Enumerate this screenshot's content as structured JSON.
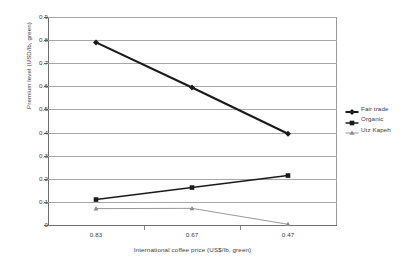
{
  "chart_data": {
    "type": "line",
    "title": "",
    "xlabel": "International coffee price (US$/lb, green)",
    "ylabel": "Premium level (USD/lb, green)",
    "categories": [
      "0.83",
      "0.67",
      "0.47"
    ],
    "x_tick_labels": [
      "0.83",
      "0.67",
      "0.47"
    ],
    "y_tick_labels": [
      "0.9",
      "0.8",
      "0.7",
      "0.6",
      "0.5",
      "0.4",
      "0.3",
      "0.2",
      "0.1",
      "0"
    ],
    "y_tick_values": [
      0.9,
      0.8,
      0.7,
      0.6,
      0.5,
      0.4,
      0.3,
      0.2,
      0.1,
      0
    ],
    "ylim": [
      0,
      0.9
    ],
    "grid": "horizontal",
    "legend_position": "right",
    "series": [
      {
        "name": "Fair trade",
        "marker": "diamond",
        "color": "#1a1a1a",
        "line_width": 2.1,
        "values": [
          0.79,
          0.595,
          0.395
        ]
      },
      {
        "name": "Organic",
        "marker": "square",
        "color": "#1a1a1a",
        "line_width": 1.5,
        "values": [
          0.11,
          0.162,
          0.214
        ]
      },
      {
        "name": "Utz Kapeh",
        "marker": "triangle",
        "color": "#8c8c8c",
        "line_width": 0.9,
        "values": [
          0.071,
          0.072,
          0.003
        ]
      }
    ]
  },
  "legend": {
    "items": [
      {
        "label": "Fair trade"
      },
      {
        "label": "Organic"
      },
      {
        "label": "Utz Kapeh"
      }
    ]
  }
}
